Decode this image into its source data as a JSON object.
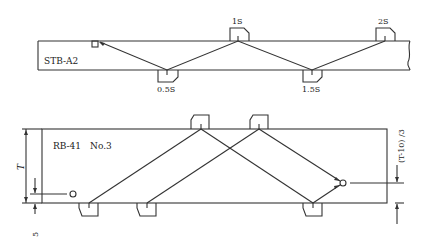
{
  "upper_diagram": {
    "block_label": "STB-A2",
    "probe_labels": {
      "p05": "0.5S",
      "p1": "1S",
      "p15": "1.5S",
      "p2": "2S"
    }
  },
  "lower_diagram": {
    "block_label": "RB-41　No.3",
    "dimension_T": "T",
    "dimension_hole_offset": "(T-10) /3",
    "dimension_bottom": "5"
  },
  "colors": {
    "line": "#333333",
    "background": "#ffffff"
  }
}
